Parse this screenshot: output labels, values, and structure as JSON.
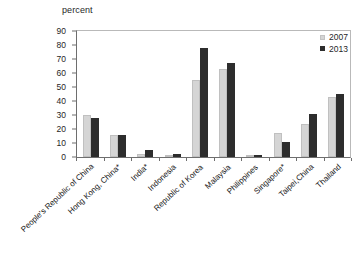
{
  "chart_data": {
    "type": "bar",
    "title": "",
    "subtitle": "",
    "xlabel": "",
    "ylabel": "percent",
    "ylim": [
      0,
      90
    ],
    "ytick_step": 10,
    "yticks": [
      0,
      10,
      20,
      30,
      40,
      50,
      60,
      70,
      80,
      90
    ],
    "grid": false,
    "legend_position": "top-right",
    "categories": [
      "People's Republic of China",
      "Hong Kong, China*",
      "India*",
      "Indonesia",
      "Republic of Korea",
      "Malaysia",
      "Philippines",
      "Singapore*",
      "Taipei,China",
      "Thailand"
    ],
    "series": [
      {
        "name": "2007",
        "color": "#d5d5d5",
        "values": [
          30,
          16,
          2.5,
          1.5,
          55,
          63,
          0.5,
          17,
          23.5,
          43
        ]
      },
      {
        "name": "2013",
        "color": "#2d2d2d",
        "values": [
          28,
          15.5,
          5,
          2.5,
          78,
          67.5,
          1.5,
          11,
          30.5,
          45
        ]
      }
    ]
  },
  "legend": {
    "entries": [
      {
        "label": "2007",
        "swatch": "legend-swatch-2007"
      },
      {
        "label": "2013",
        "swatch": "legend-swatch-2013"
      }
    ]
  }
}
